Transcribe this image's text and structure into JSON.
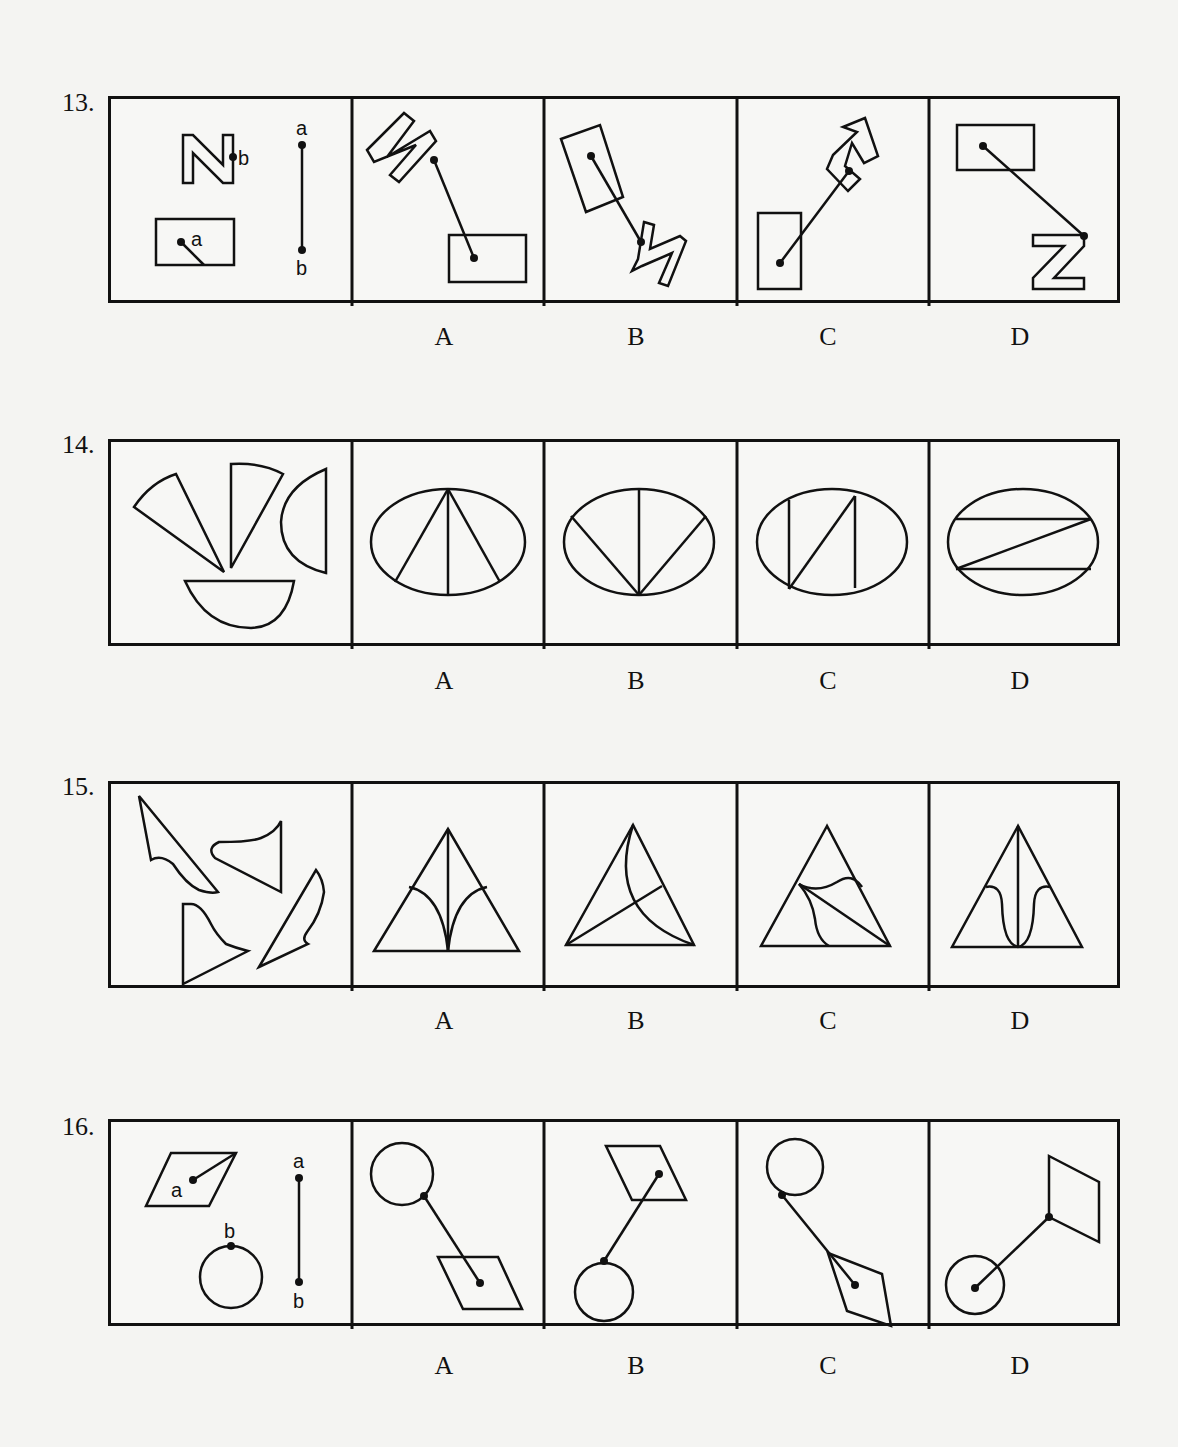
{
  "questions": [
    {
      "number": "13.",
      "description": "N shape with point b and rectangle with point a connected by segment a-b; choose the assembled figure",
      "options": [
        "A",
        "B",
        "C",
        "D"
      ],
      "stimulus_labels": {
        "point_a": "a",
        "point_b": "b",
        "segment_top": "a",
        "segment_bottom": "b"
      }
    },
    {
      "number": "14.",
      "description": "Four pieces (two sectors, two half-ellipses) to be assembled into an ellipse; choose the matching division",
      "options": [
        "A",
        "B",
        "C",
        "D"
      ]
    },
    {
      "number": "15.",
      "description": "Four curved pieces to be assembled into a triangle; choose the matching division",
      "options": [
        "A",
        "B",
        "C",
        "D"
      ]
    },
    {
      "number": "16.",
      "description": "Parallelogram with point a and circle with point b connected by segment a-b; choose the assembled figure",
      "options": [
        "A",
        "B",
        "C",
        "D"
      ],
      "stimulus_labels": {
        "point_a": "a",
        "point_b": "b",
        "segment_top": "a",
        "segment_bottom": "b"
      }
    }
  ]
}
